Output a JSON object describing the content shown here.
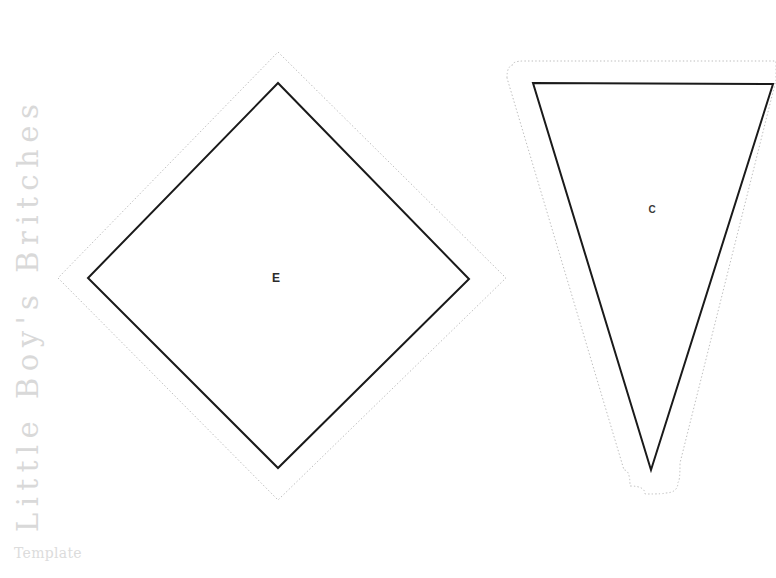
{
  "page": {
    "background_color": "#ffffff",
    "width": 776,
    "height": 578
  },
  "sidebar": {
    "vertical_title": "Little Boy's Britches",
    "subtitle": "Template",
    "title_color": "#d9d9d9",
    "subtitle_color": "#dcdcdc"
  },
  "pattern": {
    "cut_line_color": "#1a1a1a",
    "seam_allowance_color": "#bdbdbd",
    "pieces": [
      {
        "id": "piece-e",
        "label": "E",
        "shape": "diamond",
        "label_position": {
          "x": 276,
          "y": 278
        },
        "cut_points": [
          {
            "x": 278,
            "y": 83
          },
          {
            "x": 469,
            "y": 279
          },
          {
            "x": 278,
            "y": 468
          },
          {
            "x": 88,
            "y": 278
          }
        ],
        "seam_points": [
          {
            "x": 278,
            "y": 52
          },
          {
            "x": 506,
            "y": 278
          },
          {
            "x": 278,
            "y": 500
          },
          {
            "x": 58,
            "y": 278
          }
        ]
      },
      {
        "id": "piece-c",
        "label": "C",
        "shape": "triangle",
        "label_position": {
          "x": 652,
          "y": 210
        },
        "cut_points": [
          {
            "x": 533,
            "y": 83
          },
          {
            "x": 773,
            "y": 84
          },
          {
            "x": 651,
            "y": 470
          }
        ],
        "seam_points": [
          {
            "x": 507,
            "y": 78
          },
          {
            "x": 512,
            "y": 66
          },
          {
            "x": 524,
            "y": 61
          },
          {
            "x": 776,
            "y": 61
          },
          {
            "x": 776,
            "y": 80
          },
          {
            "x": 680,
            "y": 463
          },
          {
            "x": 678,
            "y": 482
          },
          {
            "x": 665,
            "y": 493
          },
          {
            "x": 645,
            "y": 494
          },
          {
            "x": 630,
            "y": 486
          },
          {
            "x": 624,
            "y": 470
          }
        ]
      }
    ]
  }
}
